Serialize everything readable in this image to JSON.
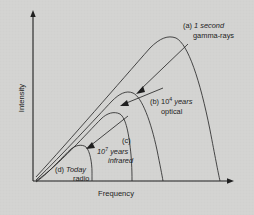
{
  "figure": {
    "background_color": "#d4d4d2",
    "ink_color": "#1e1e1e"
  },
  "axes": {
    "x_label": "Frequency",
    "y_label": "Intensity",
    "x_arrow_icon": "arrow-right-icon",
    "y_arrow_icon": "arrow-up-icon"
  },
  "curves": [
    {
      "key": "a",
      "marker": "(a)",
      "line1_plain": "(a) ",
      "line1_italic": "1 second",
      "line2": "gamma-rays",
      "epoch": "1 second",
      "band": "gamma-rays",
      "peak_x": 172,
      "peak_y": 36,
      "end_x": 221
    },
    {
      "key": "b",
      "marker": "(b)",
      "line1_prefix": "(b) 10",
      "line1_exponent": "4",
      "line1_suffix": " years",
      "line2": "optical",
      "epoch": "10^4 years",
      "band": "optical",
      "peak_x": 125,
      "peak_y": 91,
      "end_x": 165
    },
    {
      "key": "c",
      "marker": "(c)",
      "line1_prefix": "10",
      "line1_exponent": "7",
      "line1_suffix": " years",
      "line2": "infrared",
      "epoch": "10^7 years",
      "band": "infrared",
      "peak_x": 112,
      "peak_y": 113,
      "end_x": 133
    },
    {
      "key": "d",
      "marker": "(d)",
      "line1_plain": "(d) ",
      "line1_italic": "Today",
      "line2": "radio",
      "epoch": "Today",
      "band": "radio",
      "peak_x": 75,
      "peak_y": 146,
      "end_x": 93
    }
  ]
}
